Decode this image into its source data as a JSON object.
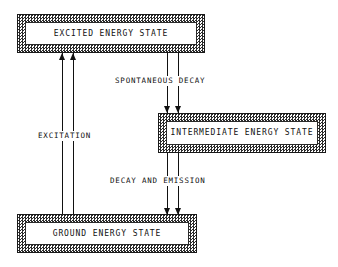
{
  "diagram": {
    "background_color": "#ffffff",
    "ink_color": "#111111",
    "states": [
      {
        "id": "excited",
        "label": "EXCITED ENERGY STATE",
        "fill": "checkered",
        "level": "top"
      },
      {
        "id": "intermediate",
        "label": "INTERMEDIATE ENERGY STATE",
        "fill": "checkered",
        "level": "middle"
      },
      {
        "id": "ground",
        "label": "GROUND ENERGY STATE",
        "fill": "checkered",
        "level": "bottom"
      }
    ],
    "transitions": [
      {
        "id": "excitation",
        "label": "EXCITATION",
        "from": "ground",
        "to": "excited",
        "direction": "up",
        "arrow_count": 2
      },
      {
        "id": "spontaneous-decay",
        "label": "SPONTANEOUS DECAY",
        "from": "excited",
        "to": "intermediate",
        "direction": "down",
        "arrow_count": 2
      },
      {
        "id": "decay-and-emission",
        "label": "DECAY AND EMISSION",
        "from": "intermediate",
        "to": "ground",
        "direction": "down",
        "arrow_count": 2
      }
    ]
  }
}
